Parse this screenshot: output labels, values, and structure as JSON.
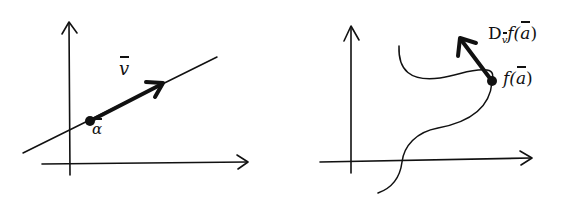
{
  "diagrams": [
    {
      "name": "left",
      "description": "Line through point a with direction vector v",
      "labels": {
        "vector": "v",
        "point": "α"
      }
    },
    {
      "name": "right",
      "description": "Curve with point f(a) and directional derivative arrow",
      "labels": {
        "derivative_prefix": "D",
        "derivative_sub": "v",
        "derivative_func": "f(",
        "derivative_arg": "a",
        "derivative_close": ")",
        "point_func": "f(",
        "point_arg": "a",
        "point_close": ")"
      }
    }
  ],
  "colors": {
    "ink": "#111111",
    "background": "#ffffff"
  }
}
